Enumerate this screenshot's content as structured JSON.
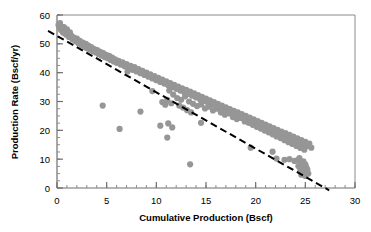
{
  "chart_data": {
    "type": "scatter",
    "title": "",
    "subtitle": "",
    "xlabel": "Cumulative Production (Bscf)",
    "ylabel": "Production Rate (Bscf/yr)",
    "xlim": [
      0,
      30
    ],
    "ylim": [
      0,
      60
    ],
    "x_major_ticks": [
      0,
      5,
      10,
      15,
      20,
      25,
      30
    ],
    "y_major_ticks": [
      0,
      10,
      20,
      30,
      40,
      50,
      60
    ],
    "x_tick_labels": [
      "0",
      "5",
      "10",
      "15",
      "20",
      "25",
      "30"
    ],
    "y_tick_labels": [
      "0",
      "10",
      "20",
      "30",
      "40",
      "50",
      "60"
    ],
    "x_minor_step": 1,
    "y_minor_step": 2.5,
    "grid": false,
    "legend": null,
    "marker": {
      "shape": "circle",
      "color": "#969696",
      "size_px": 5
    },
    "annotations": [
      {
        "type": "trend-line",
        "style": "dashed",
        "color": "#000000",
        "x_start": -0.9,
        "y_start": 54.5,
        "x_end": 27.4,
        "y_end": -0.8,
        "slope": -1.955,
        "intercept": 52.7,
        "x_intercept": 27.0
      }
    ],
    "series": [
      {
        "name": "Production rate vs cumulative production",
        "color": "#969696",
        "points": [
          [
            0.15,
            56.5
          ],
          [
            0.25,
            55.6
          ],
          [
            0.3,
            57.2
          ],
          [
            0.4,
            54.8
          ],
          [
            0.45,
            56.0
          ],
          [
            0.55,
            55.2
          ],
          [
            0.6,
            53.9
          ],
          [
            0.7,
            55.8
          ],
          [
            0.8,
            54.2
          ],
          [
            0.9,
            53.2
          ],
          [
            1.0,
            55.0
          ],
          [
            1.1,
            53.6
          ],
          [
            1.2,
            52.4
          ],
          [
            1.3,
            54.0
          ],
          [
            1.45,
            52.8
          ],
          [
            1.55,
            51.6
          ],
          [
            1.7,
            52.2
          ],
          [
            1.85,
            50.9
          ],
          [
            2.0,
            51.8
          ],
          [
            2.15,
            50.2
          ],
          [
            2.3,
            51.0
          ],
          [
            2.45,
            49.6
          ],
          [
            2.6,
            50.4
          ],
          [
            2.75,
            49.0
          ],
          [
            2.9,
            50.0
          ],
          [
            3.0,
            48.5
          ],
          [
            3.15,
            49.4
          ],
          [
            3.3,
            48.0
          ],
          [
            3.45,
            48.9
          ],
          [
            3.6,
            47.4
          ],
          [
            3.75,
            48.2
          ],
          [
            3.9,
            47.0
          ],
          [
            4.05,
            47.8
          ],
          [
            4.2,
            46.4
          ],
          [
            4.35,
            47.2
          ],
          [
            4.5,
            45.9
          ],
          [
            4.65,
            46.8
          ],
          [
            4.8,
            45.4
          ],
          [
            4.95,
            46.2
          ],
          [
            5.1,
            45.0
          ],
          [
            5.25,
            45.8
          ],
          [
            5.4,
            44.4
          ],
          [
            5.55,
            45.2
          ],
          [
            5.7,
            43.9
          ],
          [
            5.85,
            44.6
          ],
          [
            6.0,
            43.4
          ],
          [
            6.2,
            44.1
          ],
          [
            6.4,
            42.8
          ],
          [
            6.6,
            43.6
          ],
          [
            6.8,
            42.2
          ],
          [
            7.0,
            43.0
          ],
          [
            7.2,
            41.6
          ],
          [
            7.4,
            42.4
          ],
          [
            7.6,
            41.0
          ],
          [
            7.8,
            41.9
          ],
          [
            8.0,
            40.4
          ],
          [
            8.2,
            41.2
          ],
          [
            8.4,
            39.8
          ],
          [
            8.6,
            40.6
          ],
          [
            8.8,
            39.2
          ],
          [
            9.0,
            40.0
          ],
          [
            9.2,
            38.6
          ],
          [
            9.4,
            39.4
          ],
          [
            9.6,
            38.0
          ],
          [
            9.8,
            38.8
          ],
          [
            10.0,
            37.4
          ],
          [
            10.2,
            38.2
          ],
          [
            10.4,
            36.8
          ],
          [
            10.6,
            37.6
          ],
          [
            10.8,
            36.2
          ],
          [
            11.0,
            37.0
          ],
          [
            11.2,
            35.6
          ],
          [
            11.4,
            36.4
          ],
          [
            11.6,
            35.0
          ],
          [
            11.8,
            35.8
          ],
          [
            12.0,
            34.4
          ],
          [
            12.2,
            35.2
          ],
          [
            12.4,
            33.8
          ],
          [
            12.6,
            34.6
          ],
          [
            12.8,
            33.2
          ],
          [
            13.0,
            34.0
          ],
          [
            13.2,
            32.6
          ],
          [
            13.4,
            33.4
          ],
          [
            13.6,
            32.0
          ],
          [
            13.8,
            32.8
          ],
          [
            14.0,
            31.4
          ],
          [
            14.2,
            32.2
          ],
          [
            14.4,
            30.8
          ],
          [
            14.6,
            31.6
          ],
          [
            14.8,
            30.2
          ],
          [
            15.0,
            31.0
          ],
          [
            15.2,
            29.6
          ],
          [
            15.4,
            30.4
          ],
          [
            15.6,
            29.0
          ],
          [
            15.8,
            29.8
          ],
          [
            16.0,
            28.4
          ],
          [
            16.2,
            29.2
          ],
          [
            16.4,
            27.8
          ],
          [
            16.6,
            28.6
          ],
          [
            16.8,
            27.2
          ],
          [
            17.0,
            28.0
          ],
          [
            17.2,
            26.6
          ],
          [
            17.4,
            27.4
          ],
          [
            17.6,
            26.0
          ],
          [
            17.8,
            26.8
          ],
          [
            18.0,
            25.4
          ],
          [
            18.2,
            26.2
          ],
          [
            18.4,
            24.8
          ],
          [
            18.6,
            25.6
          ],
          [
            18.8,
            24.2
          ],
          [
            19.0,
            25.0
          ],
          [
            19.2,
            23.6
          ],
          [
            19.4,
            24.4
          ],
          [
            19.6,
            23.0
          ],
          [
            19.8,
            23.8
          ],
          [
            20.0,
            22.4
          ],
          [
            20.2,
            23.2
          ],
          [
            20.4,
            21.8
          ],
          [
            20.6,
            22.6
          ],
          [
            20.8,
            21.2
          ],
          [
            21.0,
            22.0
          ],
          [
            21.2,
            20.6
          ],
          [
            21.4,
            21.4
          ],
          [
            21.6,
            20.0
          ],
          [
            21.8,
            20.8
          ],
          [
            22.0,
            19.4
          ],
          [
            22.2,
            20.2
          ],
          [
            22.4,
            18.8
          ],
          [
            22.6,
            19.6
          ],
          [
            22.8,
            18.2
          ],
          [
            23.0,
            19.0
          ],
          [
            23.2,
            17.6
          ],
          [
            23.4,
            18.4
          ],
          [
            23.6,
            17.0
          ],
          [
            23.8,
            17.8
          ],
          [
            24.0,
            16.4
          ],
          [
            24.2,
            17.2
          ],
          [
            24.4,
            15.8
          ],
          [
            24.6,
            16.6
          ],
          [
            24.8,
            15.2
          ],
          [
            25.0,
            16.0
          ],
          [
            25.2,
            14.6
          ],
          [
            25.4,
            15.4
          ],
          [
            25.6,
            14.0
          ],
          [
            11.3,
            33.8
          ],
          [
            11.7,
            32.4
          ],
          [
            12.1,
            31.2
          ],
          [
            12.5,
            30.6
          ],
          [
            12.9,
            31.8
          ],
          [
            13.3,
            30.0
          ],
          [
            13.7,
            29.2
          ],
          [
            14.1,
            28.4
          ],
          [
            14.5,
            29.0
          ],
          [
            14.9,
            27.6
          ],
          [
            15.3,
            28.2
          ],
          [
            15.7,
            26.9
          ],
          [
            16.1,
            27.5
          ],
          [
            16.5,
            26.2
          ],
          [
            16.9,
            25.4
          ],
          [
            17.3,
            25.9
          ],
          [
            17.7,
            24.6
          ],
          [
            18.1,
            23.9
          ],
          [
            18.5,
            24.3
          ],
          [
            18.9,
            23.1
          ],
          [
            19.3,
            22.6
          ],
          [
            19.7,
            21.9
          ],
          [
            20.1,
            21.2
          ],
          [
            20.5,
            20.6
          ],
          [
            20.9,
            19.9
          ],
          [
            21.3,
            19.3
          ],
          [
            21.7,
            18.6
          ],
          [
            22.1,
            17.9
          ],
          [
            22.5,
            17.3
          ],
          [
            22.9,
            16.6
          ],
          [
            23.3,
            15.9
          ],
          [
            23.7,
            15.3
          ],
          [
            24.1,
            14.6
          ],
          [
            24.5,
            13.9
          ],
          [
            24.9,
            13.3
          ],
          [
            10.6,
            29.8
          ],
          [
            10.9,
            28.9
          ],
          [
            11.1,
            30.6
          ],
          [
            11.5,
            29.4
          ],
          [
            13.1,
            27.0
          ],
          [
            13.5,
            26.2
          ],
          [
            12.7,
            27.9
          ],
          [
            12.3,
            28.6
          ],
          [
            24.2,
            9.6
          ],
          [
            24.4,
            10.4
          ],
          [
            24.6,
            8.8
          ],
          [
            24.8,
            9.2
          ],
          [
            25.0,
            8.2
          ],
          [
            24.3,
            7.6
          ],
          [
            24.7,
            6.9
          ],
          [
            25.1,
            7.2
          ],
          [
            24.5,
            6.2
          ],
          [
            24.9,
            5.6
          ],
          [
            25.2,
            6.4
          ],
          [
            25.3,
            5.0
          ],
          [
            24.6,
            4.6
          ],
          [
            25.0,
            4.2
          ],
          [
            22.1,
            10.2
          ],
          [
            22.9,
            9.8
          ],
          [
            23.4,
            10.0
          ],
          [
            23.9,
            9.4
          ],
          [
            4.6,
            28.6
          ],
          [
            6.3,
            20.5
          ],
          [
            8.4,
            26.5
          ],
          [
            11.1,
            17.5
          ],
          [
            13.4,
            8.2
          ],
          [
            10.4,
            21.6
          ],
          [
            11.2,
            22.4
          ],
          [
            11.6,
            21.0
          ],
          [
            14.5,
            22.6
          ],
          [
            19.5,
            14.0
          ],
          [
            21.7,
            12.6
          ],
          [
            7.1,
            40.4
          ],
          [
            9.6,
            33.6
          ]
        ]
      }
    ]
  }
}
